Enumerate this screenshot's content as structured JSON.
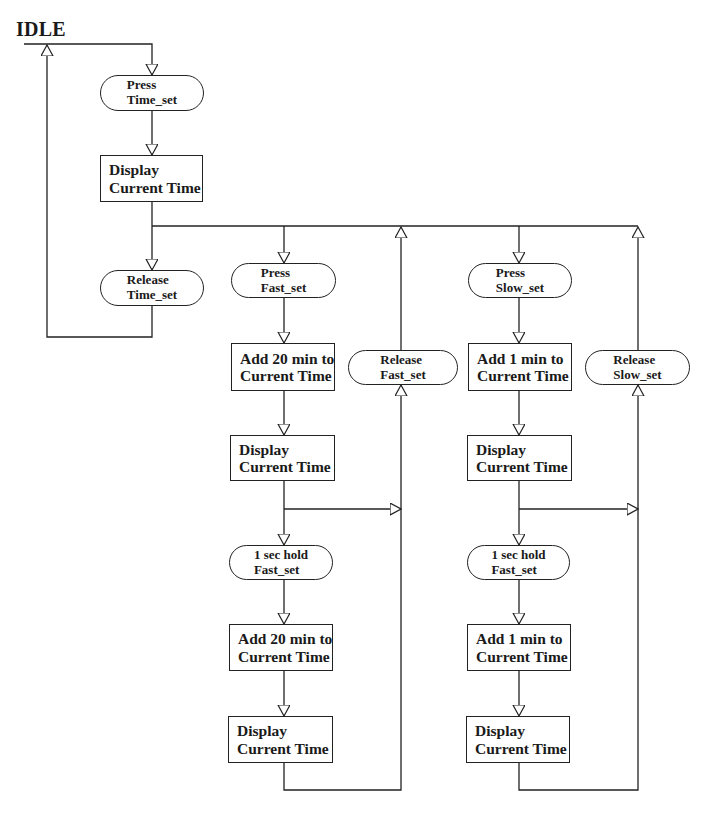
{
  "diagram": {
    "type": "flowchart",
    "title": "IDLE",
    "nodes": {
      "press_time_set": {
        "shape": "pill",
        "line1": "Press",
        "line2": "Time_set"
      },
      "display_time_1": {
        "shape": "box",
        "line1": "Display",
        "line2": "Current Time"
      },
      "release_time_set": {
        "shape": "pill",
        "line1": "Release",
        "line2": "Time_set"
      },
      "press_fast_set": {
        "shape": "pill",
        "line1": "Press",
        "line2": "Fast_set"
      },
      "add20_1": {
        "shape": "box",
        "line1": "Add 20 min to",
        "line2": "Current Time"
      },
      "display_fast_1": {
        "shape": "box",
        "line1": "Display",
        "line2": "Current Time"
      },
      "hold_fast_set": {
        "shape": "pill",
        "line1": "1 sec hold",
        "line2": "Fast_set"
      },
      "add20_2": {
        "shape": "box",
        "line1": "Add 20 min to",
        "line2": "Current Time"
      },
      "display_fast_2": {
        "shape": "box",
        "line1": "Display",
        "line2": "Current Time"
      },
      "release_fast_set": {
        "shape": "pill",
        "line1": "Release",
        "line2": "Fast_set"
      },
      "press_slow_set": {
        "shape": "pill",
        "line1": "Press",
        "line2": "Slow_set"
      },
      "add1_1": {
        "shape": "box",
        "line1": "Add 1 min to",
        "line2": "Current Time"
      },
      "display_slow_1": {
        "shape": "box",
        "line1": "Display",
        "line2": "Current Time"
      },
      "hold_slow_col": {
        "shape": "pill",
        "line1": "1 sec hold",
        "line2": "Fast_set"
      },
      "add1_2": {
        "shape": "box",
        "line1": "Add 1 min to",
        "line2": "Current Time"
      },
      "display_slow_2": {
        "shape": "box",
        "line1": "Display",
        "line2": "Current Time"
      },
      "release_slow_set": {
        "shape": "pill",
        "line1": "Release",
        "line2": "Slow_set"
      }
    },
    "edges": [
      [
        "IDLE",
        "press_time_set"
      ],
      [
        "press_time_set",
        "display_time_1"
      ],
      [
        "display_time_1",
        "release_time_set"
      ],
      [
        "release_time_set",
        "IDLE"
      ],
      [
        "display_time_1",
        "press_fast_set"
      ],
      [
        "press_fast_set",
        "add20_1"
      ],
      [
        "add20_1",
        "display_fast_1"
      ],
      [
        "display_fast_1",
        "hold_fast_set"
      ],
      [
        "display_fast_1",
        "release_fast_set"
      ],
      [
        "hold_fast_set",
        "add20_2"
      ],
      [
        "add20_2",
        "display_fast_2"
      ],
      [
        "display_fast_2",
        "release_fast_set"
      ],
      [
        "release_fast_set",
        "display_time_1"
      ],
      [
        "display_time_1",
        "press_slow_set"
      ],
      [
        "press_slow_set",
        "add1_1"
      ],
      [
        "add1_1",
        "display_slow_1"
      ],
      [
        "display_slow_1",
        "hold_slow_col"
      ],
      [
        "display_slow_1",
        "release_slow_set"
      ],
      [
        "hold_slow_col",
        "add1_2"
      ],
      [
        "add1_2",
        "display_slow_2"
      ],
      [
        "display_slow_2",
        "release_slow_set"
      ],
      [
        "release_slow_set",
        "display_time_1"
      ]
    ],
    "colors": {
      "line": "#222222",
      "background": "#ffffff",
      "text": "#1a1a1a"
    }
  }
}
